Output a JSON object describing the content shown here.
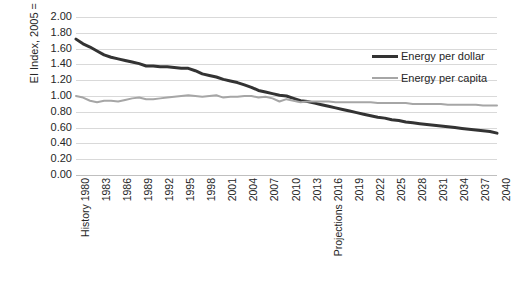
{
  "chart_data": {
    "type": "line",
    "title": "",
    "xlabel": "",
    "ylabel": "EI Index, 2005 = 1.0",
    "ylim": [
      0.0,
      2.0
    ],
    "ytick_step": 0.2,
    "yticks": [
      "2.00",
      "1.80",
      "1.60",
      "1.40",
      "1.20",
      "1.00",
      "0.80",
      "0.60",
      "0.40",
      "0.20",
      "0.00"
    ],
    "grid": true,
    "legend_position": "upper-right",
    "x_start": 1980,
    "x_end": 2040,
    "xtick_labels": [
      "History 1980",
      "1983",
      "1986",
      "1989",
      "1992",
      "1995",
      "1998",
      "2001",
      "2004",
      "2007",
      "2010",
      "2013",
      "Projections 2016",
      "2019",
      "2022",
      "2025",
      "2028",
      "2031",
      "2034",
      "2037",
      "2040"
    ],
    "xtick_years": [
      1980,
      1983,
      1986,
      1989,
      1992,
      1995,
      1998,
      2001,
      2004,
      2007,
      2010,
      2013,
      2016,
      2019,
      2022,
      2025,
      2028,
      2031,
      2034,
      2037,
      2040
    ],
    "x": [
      1980,
      1981,
      1982,
      1983,
      1984,
      1985,
      1986,
      1987,
      1988,
      1989,
      1990,
      1991,
      1992,
      1993,
      1994,
      1995,
      1996,
      1997,
      1998,
      1999,
      2000,
      2001,
      2002,
      2003,
      2004,
      2005,
      2006,
      2007,
      2008,
      2009,
      2010,
      2011,
      2012,
      2013,
      2014,
      2015,
      2016,
      2017,
      2018,
      2019,
      2020,
      2021,
      2022,
      2023,
      2024,
      2025,
      2026,
      2027,
      2028,
      2029,
      2030,
      2031,
      2032,
      2033,
      2034,
      2035,
      2036,
      2037,
      2038,
      2039,
      2040
    ],
    "series": [
      {
        "name": "Energy per dollar",
        "color": "#333333",
        "width": 3,
        "values": [
          1.72,
          1.66,
          1.62,
          1.57,
          1.52,
          1.49,
          1.47,
          1.45,
          1.43,
          1.41,
          1.38,
          1.38,
          1.37,
          1.37,
          1.36,
          1.35,
          1.35,
          1.32,
          1.28,
          1.26,
          1.24,
          1.21,
          1.19,
          1.17,
          1.14,
          1.11,
          1.07,
          1.05,
          1.03,
          1.01,
          1.0,
          0.97,
          0.94,
          0.93,
          0.91,
          0.89,
          0.87,
          0.85,
          0.83,
          0.81,
          0.79,
          0.77,
          0.75,
          0.73,
          0.72,
          0.7,
          0.69,
          0.67,
          0.66,
          0.65,
          0.64,
          0.63,
          0.62,
          0.61,
          0.6,
          0.59,
          0.58,
          0.57,
          0.56,
          0.55,
          0.53
        ]
      },
      {
        "name": "Energy per capita",
        "color": "#a6a6a6",
        "width": 2,
        "values": [
          1.0,
          0.98,
          0.94,
          0.92,
          0.94,
          0.94,
          0.93,
          0.95,
          0.97,
          0.98,
          0.96,
          0.96,
          0.97,
          0.98,
          0.99,
          1.0,
          1.01,
          1.0,
          0.99,
          1.0,
          1.01,
          0.98,
          0.99,
          0.99,
          1.0,
          1.0,
          0.98,
          0.99,
          0.97,
          0.93,
          0.96,
          0.94,
          0.92,
          0.93,
          0.93,
          0.93,
          0.93,
          0.92,
          0.92,
          0.92,
          0.92,
          0.92,
          0.92,
          0.91,
          0.91,
          0.91,
          0.91,
          0.91,
          0.9,
          0.9,
          0.9,
          0.9,
          0.9,
          0.89,
          0.89,
          0.89,
          0.89,
          0.89,
          0.88,
          0.88,
          0.88
        ]
      }
    ]
  },
  "legend": {
    "items": [
      {
        "label": "Energy per dollar"
      },
      {
        "label": "Energy per capita"
      }
    ]
  }
}
